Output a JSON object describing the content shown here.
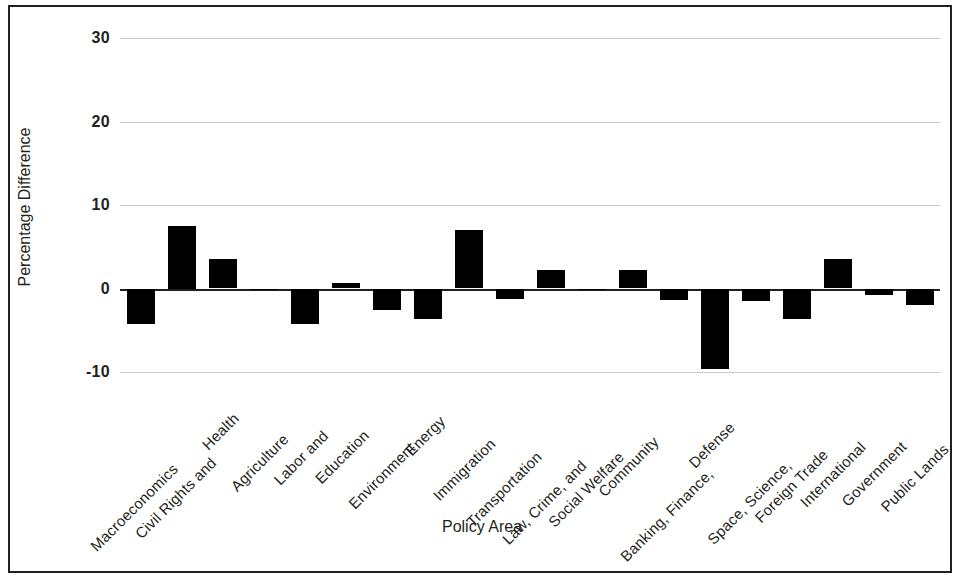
{
  "chart_data": {
    "type": "bar",
    "title": "",
    "xlabel": "Policy Area",
    "ylabel": "Percentage Difference",
    "ylim": [
      -10,
      30
    ],
    "yticks": [
      30,
      20,
      10,
      0,
      -10
    ],
    "ytick_labels": [
      "30",
      "20",
      "10",
      "0",
      "-10"
    ],
    "grid": true,
    "legend": "none",
    "bar_color": "#000000",
    "gridline_color": "#c9c9c9",
    "axis_color": "#231f20",
    "categories": [
      "Macroeconomics",
      "Civil Rights and",
      "Health",
      "Agriculture",
      "Labor and",
      "Education",
      "Environment",
      "Energy",
      "Immigration",
      "Transportation",
      "Law, Crime, and",
      "Social Welfare",
      "Community",
      "Banking, Finance,",
      "Defense",
      "Space, Science,",
      "Foreign Trade",
      "International",
      "Government",
      "Public Lands"
    ],
    "values": [
      -4.2,
      7.5,
      3.5,
      -0.2,
      -4.2,
      0.6,
      -2.6,
      -3.6,
      7.0,
      -1.2,
      2.2,
      -0.2,
      2.2,
      -1.4,
      -9.7,
      -1.5,
      -3.6,
      3.5,
      -0.8,
      -2.0
    ]
  }
}
